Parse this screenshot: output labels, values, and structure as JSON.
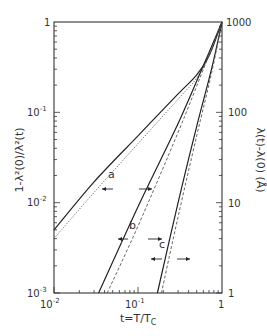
{
  "chart_data": {
    "type": "line",
    "title": "",
    "xlabel": "t=T/T_C",
    "ylabel_left": "1-λ²(0)/λ²(t)",
    "ylabel_right": "λ(t)-λ(0) (Å)",
    "xscale": "log",
    "yscale": "log",
    "xlim": [
      0.01,
      1
    ],
    "ylim_left": [
      0.001,
      1
    ],
    "ylim_right": [
      1,
      1000
    ],
    "x_ticks": [
      "10^-2",
      "10^-1",
      "1"
    ],
    "y_ticks_left": [
      "10^-3",
      "10^-2",
      "10^-1",
      "1"
    ],
    "y_ticks_right": [
      "1",
      "10",
      "100",
      "1000"
    ],
    "grid": false,
    "legend": null,
    "annotations": [
      {
        "label": "a",
        "note": "arrow pointing left toward left axis (solid) and arrow right toward right axis"
      },
      {
        "label": "b",
        "note": "arrow left / arrow right"
      },
      {
        "label": "c",
        "note": "arrow left / arrow right"
      }
    ],
    "series": [
      {
        "name": "a (left axis, solid)",
        "style": "solid",
        "x": [
          0.01,
          0.03,
          0.1,
          0.3,
          0.5,
          0.7,
          1.0
        ],
        "y": [
          0.005,
          0.017,
          0.055,
          0.16,
          0.26,
          0.42,
          1.0
        ]
      },
      {
        "name": "a (right axis, dotted)",
        "style": "dotted",
        "x": [
          0.01,
          0.03,
          0.1,
          0.3,
          0.5,
          0.7,
          1.0
        ],
        "y": [
          0.004,
          0.013,
          0.045,
          0.14,
          0.24,
          0.42,
          1.0
        ]
      },
      {
        "name": "b (left axis, solid)",
        "style": "solid",
        "x": [
          0.034,
          0.1,
          0.3,
          0.6,
          1.0
        ],
        "y": [
          0.001,
          0.009,
          0.075,
          0.33,
          1.0
        ]
      },
      {
        "name": "b (right axis, dashed)",
        "style": "dashed",
        "x": [
          0.043,
          0.1,
          0.3,
          0.6,
          1.0
        ],
        "y": [
          0.001,
          0.0055,
          0.06,
          0.3,
          1.0
        ]
      },
      {
        "name": "c (left axis, solid)",
        "style": "solid",
        "x": [
          0.17,
          0.3,
          0.5,
          0.75,
          1.0
        ],
        "y": [
          0.001,
          0.01,
          0.07,
          0.3,
          1.0
        ]
      },
      {
        "name": "c (right axis, dashed)",
        "style": "dashed",
        "x": [
          0.19,
          0.3,
          0.5,
          0.75,
          1.0
        ],
        "y": [
          0.001,
          0.007,
          0.055,
          0.27,
          1.0
        ]
      }
    ]
  },
  "axes": {
    "x_tick_labels": [
      {
        "base": "10",
        "exp": "-2"
      },
      {
        "base": "10",
        "exp": "-1"
      },
      {
        "base": "1",
        "exp": ""
      }
    ],
    "y_left_tick_labels": [
      {
        "base": "10",
        "exp": "-3"
      },
      {
        "base": "10",
        "exp": "-2"
      },
      {
        "base": "10",
        "exp": "-1"
      },
      {
        "base": "1",
        "exp": ""
      }
    ],
    "y_right_tick_labels": [
      "1",
      "10",
      "100",
      "1000"
    ],
    "xlabel_main": "t=T/T",
    "xlabel_sub": "C",
    "ylabel_left_text": "1-λ²(0)/λ²(t)",
    "ylabel_right_text": "λ(t)-λ(0) (Å)"
  },
  "labels": {
    "a": "a",
    "b": "b",
    "c": "c"
  }
}
